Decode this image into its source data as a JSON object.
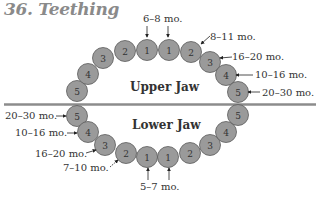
{
  "title": "36. Teething",
  "colors": {
    "tooth_fill": "#9a9a9a",
    "tooth_stroke": "#5a5a5a",
    "divider": "#8c8c8c",
    "title": "#8a8a8a"
  },
  "upper_jaw": {
    "label": "Upper Jaw",
    "teeth": [
      {
        "num": "5",
        "x": 77,
        "y": 91
      },
      {
        "num": "4",
        "x": 88,
        "y": 74
      },
      {
        "num": "3",
        "x": 103,
        "y": 58
      },
      {
        "num": "2",
        "x": 125,
        "y": 51
      },
      {
        "num": "1",
        "x": 147,
        "y": 50
      },
      {
        "num": "1",
        "x": 169,
        "y": 50
      },
      {
        "num": "2",
        "x": 191,
        "y": 52
      },
      {
        "num": "3",
        "x": 210,
        "y": 62
      },
      {
        "num": "4",
        "x": 226,
        "y": 75
      },
      {
        "num": "5",
        "x": 238,
        "y": 92
      }
    ],
    "annotations": [
      {
        "text": "6–8 mo.",
        "tooth": "1"
      },
      {
        "text": "8–11 mo.",
        "tooth": "2"
      },
      {
        "text": "16–20 mo.",
        "tooth": "3"
      },
      {
        "text": "10–16 mo.",
        "tooth": "4"
      },
      {
        "text": "20–30 mo.",
        "tooth": "5"
      }
    ]
  },
  "lower_jaw": {
    "label": "Lower Jaw",
    "teeth": [
      {
        "num": "5",
        "x": 77,
        "y": 116
      },
      {
        "num": "4",
        "x": 88,
        "y": 132
      },
      {
        "num": "3",
        "x": 105,
        "y": 145
      },
      {
        "num": "2",
        "x": 126,
        "y": 153
      },
      {
        "num": "1",
        "x": 147,
        "y": 157
      },
      {
        "num": "1",
        "x": 168,
        "y": 157
      },
      {
        "num": "2",
        "x": 190,
        "y": 153
      },
      {
        "num": "3",
        "x": 210,
        "y": 145
      },
      {
        "num": "4",
        "x": 226,
        "y": 132
      },
      {
        "num": "5",
        "x": 238,
        "y": 115
      }
    ],
    "annotations": [
      {
        "text": "20–30 mo.",
        "tooth": "5"
      },
      {
        "text": "10–16 mo.",
        "tooth": "4"
      },
      {
        "text": "16–20 mo.",
        "tooth": "3"
      },
      {
        "text": "7–10 mo.",
        "tooth": "2"
      },
      {
        "text": "5–7 mo.",
        "tooth": "1"
      }
    ]
  }
}
